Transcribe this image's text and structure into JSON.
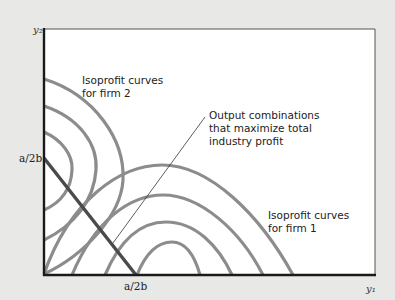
{
  "diagram": {
    "axes": {
      "y_label": "y₂",
      "x_label": "y₁",
      "y_tick": "a/2b",
      "x_tick": "a/2b"
    },
    "annotations": {
      "firm2": [
        "Isoprofit curves",
        "for firm 2"
      ],
      "firm1": [
        "Isoprofit curves",
        "for firm 1"
      ],
      "max_profit": [
        "Output combinations",
        "that maximize total",
        "industry profit"
      ]
    },
    "colors": {
      "background": "#e8e8e6",
      "plot_area": "#ffffff",
      "axis": "#1a1a1a",
      "curves": "#8c8c8c",
      "contract_line": "#4a4a4a",
      "leader": "#333333"
    }
  }
}
